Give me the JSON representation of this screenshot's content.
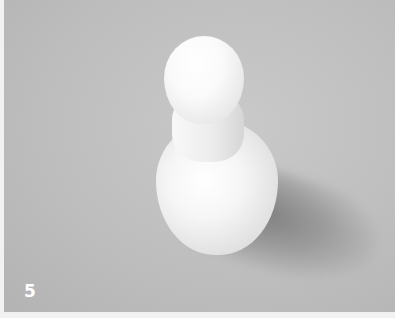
{
  "figure": {
    "label": "5",
    "colors": {
      "background": "#bdbdbd",
      "object": "#f4f4f4",
      "shadow": "#6a6a6a",
      "label": "#ffffff",
      "border": "#f2f2f2"
    }
  }
}
